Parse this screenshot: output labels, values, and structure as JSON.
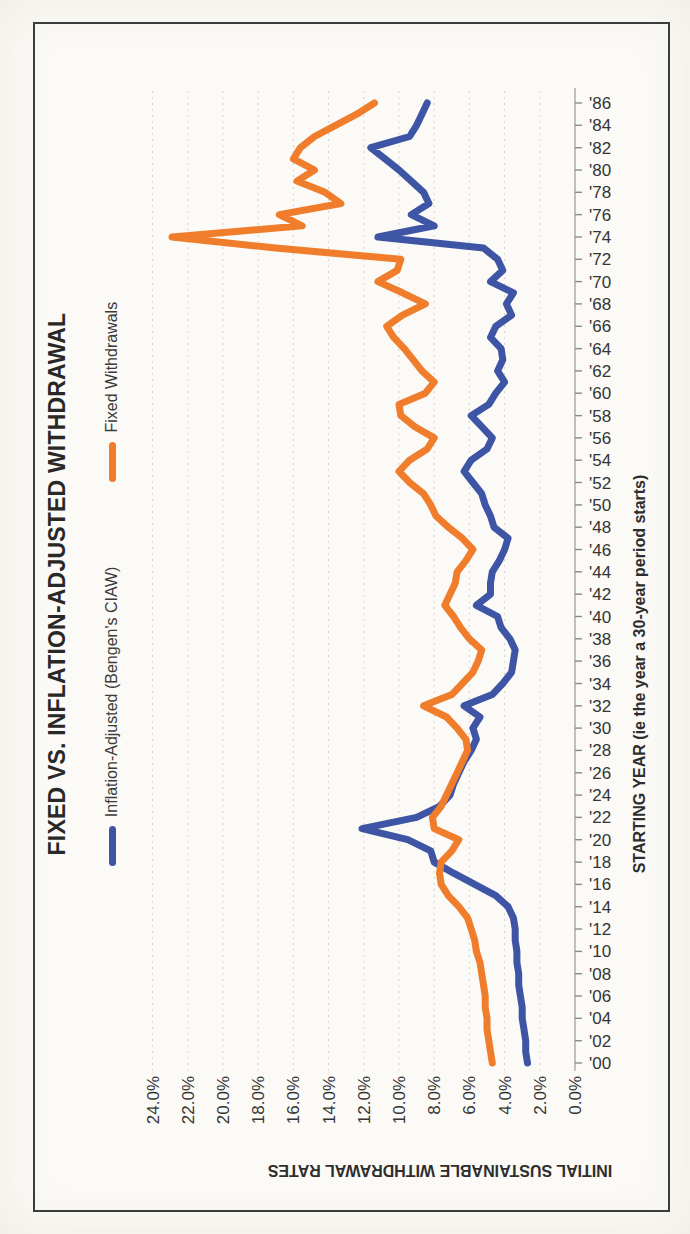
{
  "figure": {
    "paper_color": "#fbfaf6",
    "frame_color": "#3c3c3c",
    "orientation": "landscape chart printed sideways (rotated 90 degrees) on portrait page"
  },
  "chart_data": {
    "type": "line",
    "title": "FIXED VS. INFLATION-ADJUSTED WITHDRAWAL",
    "xlabel": "STARTING YEAR (ie the year a 30-year period starts)",
    "ylabel": "INITIAL SUSTAINABLE WITHDRAWAL RATES",
    "x_range": [
      1900,
      1986
    ],
    "x_step": 1,
    "x_tick_labels": [
      "'00",
      "'02",
      "'04",
      "'06",
      "'08",
      "'10",
      "'12",
      "'14",
      "'16",
      "'18",
      "'20",
      "'22",
      "'24",
      "'26",
      "'28",
      "'30",
      "'32",
      "'34",
      "'36",
      "'38",
      "'40",
      "'42",
      "'44",
      "'46",
      "'48",
      "'50",
      "'52",
      "'54",
      "'56",
      "'58",
      "'60",
      "'62",
      "'64",
      "'66",
      "'68",
      "'70",
      "'72",
      "'74",
      "'76",
      "'78",
      "'80",
      "'82",
      "'84",
      "'86"
    ],
    "ylim": [
      0,
      24
    ],
    "y_ticks": [
      0,
      2,
      4,
      6,
      8,
      10,
      12,
      14,
      16,
      18,
      20,
      22,
      24
    ],
    "y_tick_labels": [
      "0.0%",
      "2.0%",
      "4.0%",
      "6.0%",
      "8.0%",
      "10.0%",
      "12.0%",
      "14.0%",
      "16.0%",
      "18.0%",
      "20.0%",
      "22.0%",
      "24.0%"
    ],
    "grid": "dashed gridlines at each 2% tick, no year gridlines",
    "legend_position": "top",
    "series": [
      {
        "name": "Inflation-Adjusted (Bengen's CIAW)",
        "color": "#3E55A5",
        "values": [
          2.7,
          2.8,
          2.8,
          2.9,
          3.0,
          3.0,
          3.1,
          3.2,
          3.2,
          3.3,
          3.3,
          3.4,
          3.4,
          3.5,
          3.8,
          4.5,
          5.7,
          6.9,
          8.0,
          8.2,
          9.5,
          12.1,
          9.0,
          7.7,
          7.1,
          6.9,
          6.6,
          6.3,
          5.9,
          5.6,
          5.8,
          5.4,
          6.3,
          4.7,
          4.1,
          3.6,
          3.5,
          3.4,
          3.7,
          4.2,
          4.4,
          5.6,
          4.8,
          4.8,
          4.7,
          4.3,
          4.0,
          3.8,
          4.6,
          4.8,
          5.1,
          5.3,
          5.8,
          6.3,
          5.9,
          5.0,
          4.7,
          5.3,
          5.9,
          4.9,
          4.5,
          4.0,
          4.4,
          4.1,
          4.2,
          4.8,
          4.5,
          3.6,
          3.9,
          3.5,
          4.8,
          4.1,
          4.4,
          5.2,
          11.2,
          8.0,
          9.3,
          8.3,
          8.6,
          9.3,
          10.0,
          10.8,
          11.6,
          9.4,
          9.0,
          8.7,
          8.4
        ]
      },
      {
        "name": "Fixed Withdrawals",
        "color": "#EF7D2B",
        "values": [
          4.7,
          4.8,
          4.9,
          5.0,
          5.0,
          5.1,
          5.1,
          5.2,
          5.3,
          5.4,
          5.6,
          5.7,
          5.9,
          6.1,
          6.6,
          7.2,
          7.6,
          7.7,
          7.6,
          7.0,
          6.6,
          8.0,
          8.1,
          7.6,
          7.3,
          7.0,
          6.7,
          6.4,
          6.1,
          6.2,
          6.7,
          7.3,
          8.6,
          7.0,
          6.4,
          5.8,
          5.5,
          5.3,
          6.0,
          6.5,
          6.9,
          7.4,
          7.1,
          6.8,
          6.7,
          6.2,
          5.8,
          6.4,
          7.2,
          7.9,
          8.2,
          8.6,
          9.4,
          10.0,
          9.4,
          8.4,
          8.0,
          9.1,
          9.9,
          10.0,
          8.5,
          8.0,
          8.7,
          9.2,
          9.7,
          10.3,
          10.7,
          9.8,
          8.5,
          9.8,
          11.2,
          10.1,
          9.9,
          17.0,
          22.9,
          15.5,
          16.8,
          13.3,
          14.2,
          15.8,
          14.8,
          16.0,
          15.6,
          14.8,
          13.6,
          12.4,
          11.4
        ]
      }
    ]
  }
}
